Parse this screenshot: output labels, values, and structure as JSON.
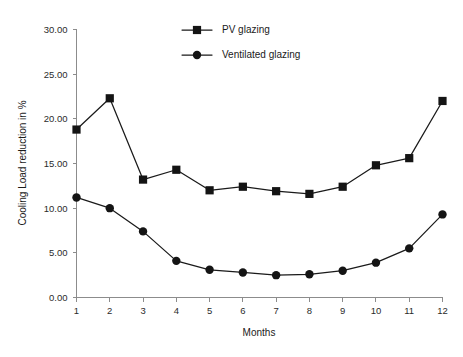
{
  "chart_data": {
    "type": "line",
    "title": "",
    "xlabel": "Months",
    "ylabel": "Cooling Load reduction in %",
    "x": [
      1,
      2,
      3,
      4,
      5,
      6,
      7,
      8,
      9,
      10,
      11,
      12
    ],
    "categories": [
      "1",
      "2",
      "3",
      "4",
      "5",
      "6",
      "7",
      "8",
      "9",
      "10",
      "11",
      "12"
    ],
    "xlim": [
      1,
      12
    ],
    "ylim": [
      0,
      30
    ],
    "ytick_values": [
      0,
      5,
      10,
      15,
      20,
      25,
      30
    ],
    "ytick_labels": [
      "0.00",
      "5.00",
      "10.00",
      "15.00",
      "20.00",
      "25.00",
      "30.00"
    ],
    "xtick_labels": [
      "1",
      "2",
      "3",
      "4",
      "5",
      "6",
      "7",
      "8",
      "9",
      "10",
      "11",
      "12"
    ],
    "grid": false,
    "legend_position": "top-center",
    "series": [
      {
        "name": "PV glazing",
        "marker": "square",
        "color": "#141414",
        "values": [
          18.8,
          22.3,
          13.2,
          14.3,
          12.0,
          12.4,
          11.9,
          11.6,
          12.4,
          14.8,
          15.6,
          22.0
        ]
      },
      {
        "name": "Ventilated glazing",
        "marker": "circle",
        "color": "#141414",
        "values": [
          11.2,
          10.0,
          7.4,
          4.1,
          3.1,
          2.8,
          2.5,
          2.6,
          3.0,
          3.9,
          5.5,
          9.3
        ]
      }
    ]
  },
  "legend": {
    "entries": [
      {
        "label": "PV glazing",
        "marker": "square"
      },
      {
        "label": "Ventilated glazing",
        "marker": "circle"
      }
    ]
  },
  "axes": {
    "y_title": "Cooling Load reduction in %",
    "x_title": "Months"
  }
}
